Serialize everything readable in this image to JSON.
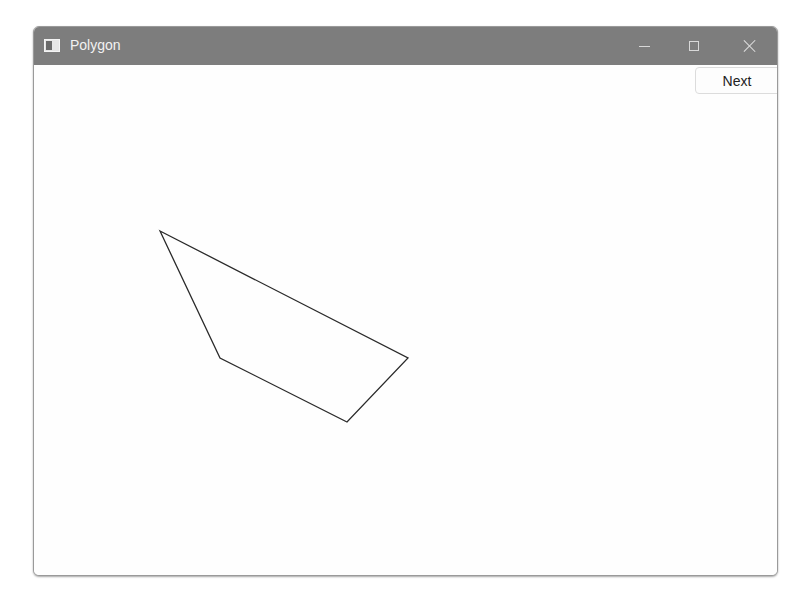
{
  "window": {
    "title": "Polygon",
    "icon": "app-window-icon",
    "controls": [
      "minimize",
      "maximize",
      "close"
    ]
  },
  "toolbar": {
    "next_label": "Next"
  },
  "canvas": {
    "polygon_points": "126,166 374,293 313,357 186,293",
    "stroke": "#2a2a2a",
    "fill": "none"
  }
}
